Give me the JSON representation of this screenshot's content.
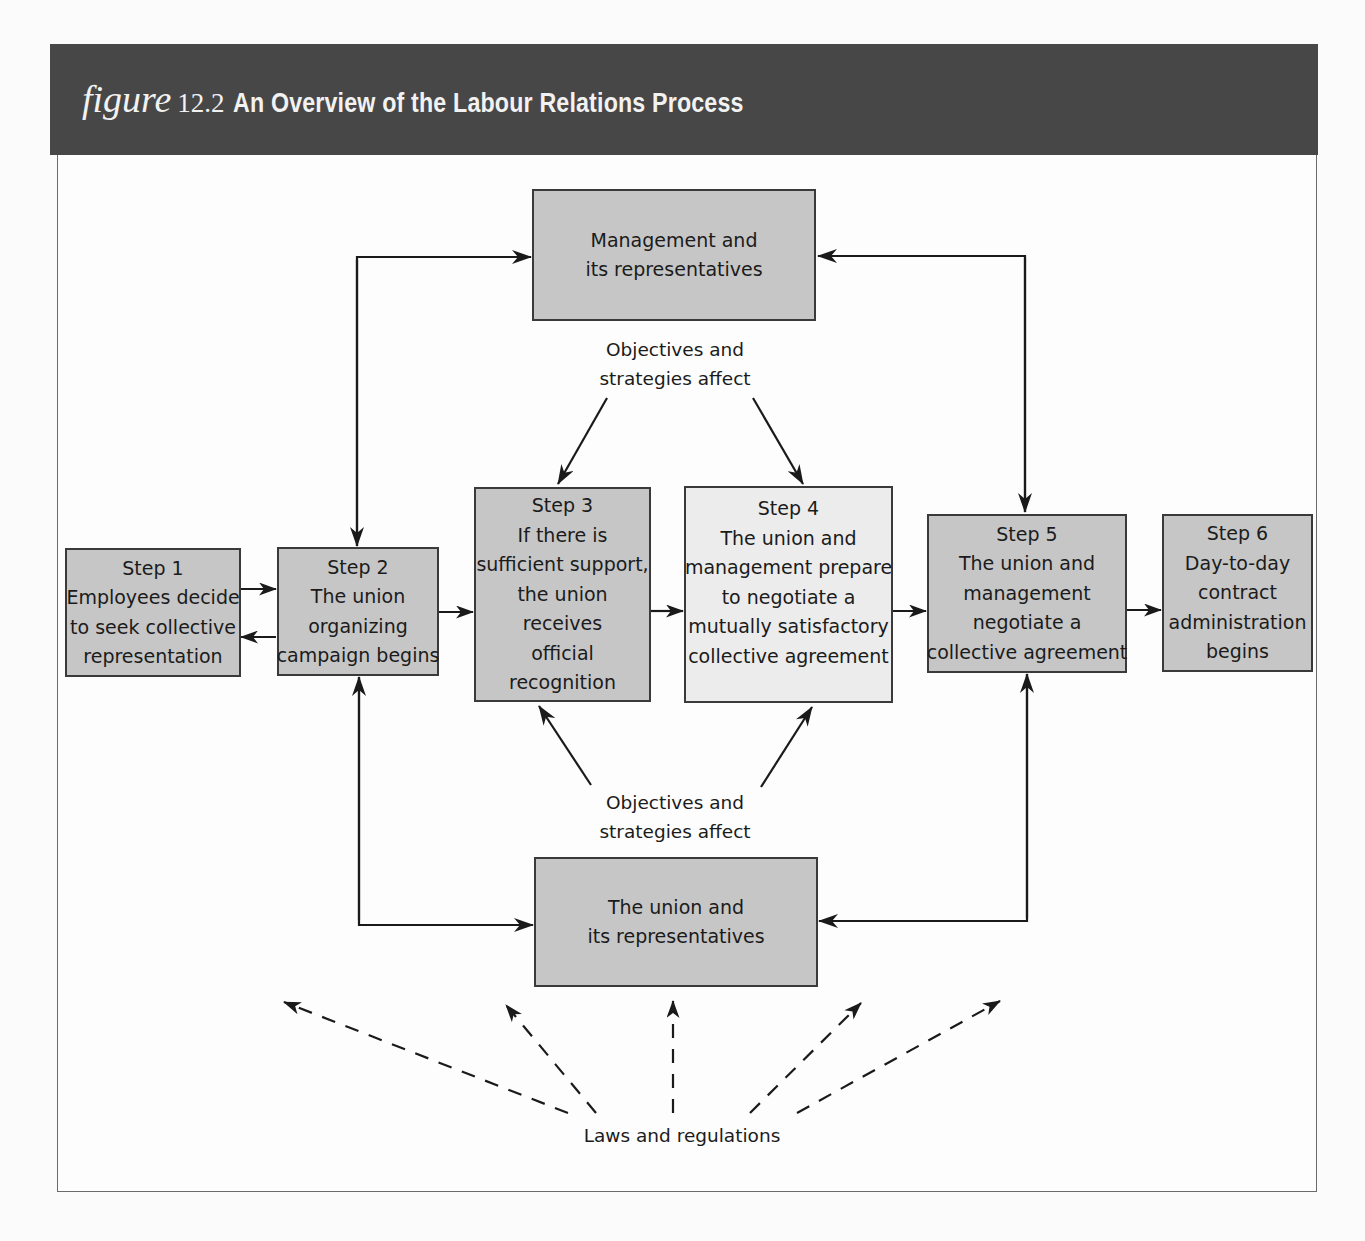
{
  "header": {
    "figure_word": "figure",
    "figure_number": "12.2",
    "title": "An Overview of the Labour Relations Process",
    "background_color": "#474747"
  },
  "actors": {
    "management": {
      "lines": [
        "Management and",
        "its representatives"
      ]
    },
    "union": {
      "lines": [
        "The union and",
        "its representatives"
      ]
    }
  },
  "steps": [
    {
      "label": "Step 1",
      "lines": [
        "Employees decide",
        "to seek collective",
        "representation"
      ]
    },
    {
      "label": "Step 2",
      "lines": [
        "The union",
        "organizing",
        "campaign begins"
      ]
    },
    {
      "label": "Step 3",
      "lines": [
        "If there is",
        "sufficient support,",
        "the union",
        "receives",
        "official",
        "recognition"
      ]
    },
    {
      "label": "Step 4",
      "lines": [
        "The union and",
        "management prepare",
        "to negotiate a",
        "mutually satisfactory",
        "collective agreement"
      ]
    },
    {
      "label": "Step 5",
      "lines": [
        "The union and",
        "management",
        "negotiate a",
        "collective agreement"
      ]
    },
    {
      "label": "Step 6",
      "lines": [
        "Day-to-day",
        "contract",
        "administration",
        "begins"
      ]
    }
  ],
  "annotations": {
    "top_influence": [
      "Objectives and",
      "strategies affect"
    ],
    "bottom_influence": [
      "Objectives and",
      "strategies affect"
    ],
    "laws": "Laws and regulations"
  },
  "colors": {
    "box_fill": "#c6c6c6",
    "step4_fill": "#ececec",
    "line": "#1a1a1a"
  }
}
